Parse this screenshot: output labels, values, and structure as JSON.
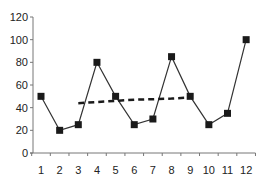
{
  "chart_data": {
    "type": "line",
    "title": "",
    "xlabel": "",
    "ylabel": "",
    "categories": [
      "1",
      "2",
      "3",
      "4",
      "5",
      "6",
      "7",
      "8",
      "9",
      "10",
      "11",
      "12"
    ],
    "x": [
      1,
      2,
      3,
      4,
      5,
      6,
      7,
      8,
      9,
      10,
      11,
      12
    ],
    "ylim": [
      0,
      120
    ],
    "yticks": [
      0,
      20,
      40,
      60,
      80,
      100,
      120
    ],
    "grid": false,
    "legend": null,
    "series": [
      {
        "name": "Data",
        "style": "solid line with square markers",
        "color": "#222222",
        "values": [
          50,
          20,
          25,
          80,
          50,
          25,
          30,
          85,
          50,
          25,
          35,
          100
        ]
      },
      {
        "name": "Moving average",
        "style": "dashed line, no markers",
        "color": "#222222",
        "x": [
          3,
          4,
          5,
          6,
          7,
          8,
          9
        ],
        "values": [
          44,
          45,
          46,
          47,
          47.5,
          48,
          49
        ]
      }
    ]
  }
}
